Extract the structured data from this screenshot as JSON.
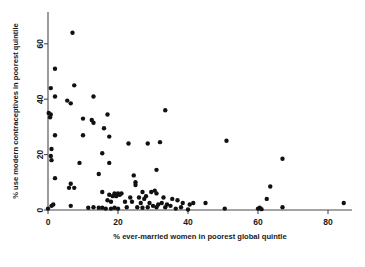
{
  "chart_data": {
    "type": "scatter",
    "title": "",
    "xlabel": "% ever-married women in poorest global quintle",
    "ylabel": "% use modern contraceptives in poorest quintile",
    "xlim": [
      -2,
      88
    ],
    "ylim": [
      -2,
      68
    ],
    "xticks": [
      0,
      20,
      40,
      60,
      80
    ],
    "yticks": [
      0,
      20,
      40,
      60
    ],
    "xticklabels": [
      "0",
      "20",
      "40",
      "60",
      "80"
    ],
    "yticklabels": [
      "0",
      "20",
      "40",
      "60"
    ],
    "grid": false,
    "legend": null,
    "marker": "filled-circle",
    "marker_color": "#111111",
    "points": [
      [
        7.0,
        64.0
      ],
      [
        2.0,
        51.0
      ],
      [
        0.8,
        44.0
      ],
      [
        7.5,
        45.0
      ],
      [
        2.0,
        41.0
      ],
      [
        6.5,
        38.5
      ],
      [
        5.5,
        39.5
      ],
      [
        13.0,
        41.0
      ],
      [
        33.5,
        36.0
      ],
      [
        0.2,
        35.0
      ],
      [
        0.8,
        34.5
      ],
      [
        0.6,
        33.5
      ],
      [
        10.0,
        33.0
      ],
      [
        12.5,
        32.5
      ],
      [
        17.0,
        34.5
      ],
      [
        13.0,
        31.5
      ],
      [
        16.0,
        29.5
      ],
      [
        10.0,
        27.0
      ],
      [
        17.5,
        26.5
      ],
      [
        2.0,
        27.0
      ],
      [
        23.0,
        24.0
      ],
      [
        28.5,
        24.0
      ],
      [
        32.0,
        24.5
      ],
      [
        51.0,
        25.0
      ],
      [
        1.0,
        22.0
      ],
      [
        0.8,
        19.5
      ],
      [
        15.5,
        20.5
      ],
      [
        1.0,
        18.0
      ],
      [
        9.0,
        17.0
      ],
      [
        17.5,
        17.0
      ],
      [
        31.0,
        14.5
      ],
      [
        67.0,
        18.5
      ],
      [
        14.5,
        13.0
      ],
      [
        24.5,
        12.5
      ],
      [
        2.0,
        11.5
      ],
      [
        25.0,
        10.0
      ],
      [
        25.0,
        9.0
      ],
      [
        6.5,
        9.5
      ],
      [
        6.0,
        8.0
      ],
      [
        7.5,
        8.0
      ],
      [
        63.5,
        8.5
      ],
      [
        15.5,
        6.5
      ],
      [
        19.0,
        6.0
      ],
      [
        20.0,
        6.0
      ],
      [
        21.0,
        6.0
      ],
      [
        27.0,
        6.5
      ],
      [
        29.5,
        6.5
      ],
      [
        30.5,
        7.0
      ],
      [
        31.0,
        6.0
      ],
      [
        28.0,
        5.0
      ],
      [
        17.5,
        5.5
      ],
      [
        18.5,
        5.0
      ],
      [
        19.5,
        5.0
      ],
      [
        20.5,
        5.5
      ],
      [
        23.5,
        4.5
      ],
      [
        26.0,
        4.5
      ],
      [
        27.5,
        4.0
      ],
      [
        33.0,
        4.5
      ],
      [
        35.5,
        4.0
      ],
      [
        37.0,
        3.5
      ],
      [
        62.5,
        4.0
      ],
      [
        17.0,
        3.5
      ],
      [
        18.0,
        3.0
      ],
      [
        22.0,
        3.0
      ],
      [
        24.0,
        3.0
      ],
      [
        26.5,
        2.5
      ],
      [
        29.0,
        2.5
      ],
      [
        31.5,
        2.0
      ],
      [
        32.5,
        2.5
      ],
      [
        34.0,
        2.0
      ],
      [
        38.5,
        2.5
      ],
      [
        40.5,
        2.0
      ],
      [
        41.5,
        2.5
      ],
      [
        45.0,
        2.5
      ],
      [
        84.5,
        2.5
      ],
      [
        0.0,
        0.5
      ],
      [
        1.0,
        1.5
      ],
      [
        1.5,
        2.0
      ],
      [
        6.5,
        1.5
      ],
      [
        11.5,
        0.8
      ],
      [
        13.0,
        1.0
      ],
      [
        14.5,
        0.8
      ],
      [
        15.5,
        0.8
      ],
      [
        16.5,
        0.5
      ],
      [
        18.0,
        0.5
      ],
      [
        19.0,
        0.8
      ],
      [
        20.0,
        0.5
      ],
      [
        22.5,
        1.0
      ],
      [
        25.5,
        1.0
      ],
      [
        27.0,
        0.8
      ],
      [
        28.5,
        1.0
      ],
      [
        30.0,
        1.5
      ],
      [
        31.0,
        1.0
      ],
      [
        33.5,
        1.0
      ],
      [
        35.0,
        1.5
      ],
      [
        36.5,
        0.5
      ],
      [
        38.0,
        1.0
      ],
      [
        40.0,
        0.2
      ],
      [
        50.5,
        0.5
      ],
      [
        60.0,
        0.5
      ],
      [
        60.5,
        0.8
      ],
      [
        61.0,
        0.3
      ],
      [
        67.0,
        1.0
      ]
    ]
  }
}
